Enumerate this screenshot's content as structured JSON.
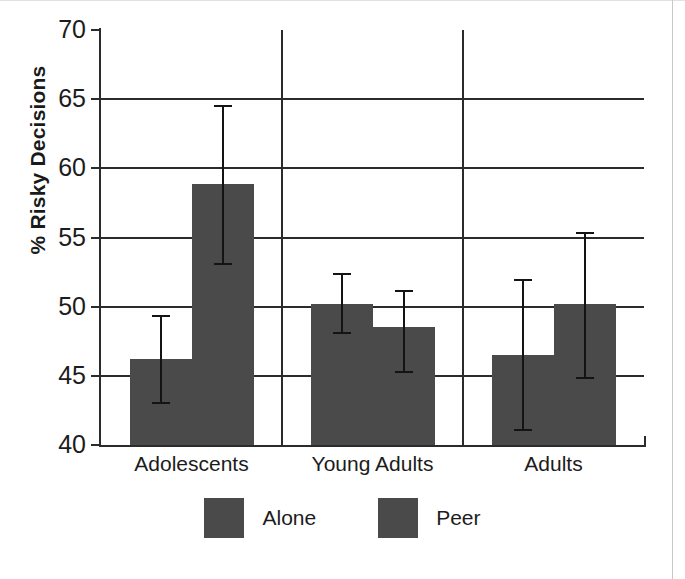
{
  "chart_data": {
    "type": "bar",
    "title": "",
    "xlabel": "",
    "ylabel": "% Risky Decisions",
    "ylim": [
      40,
      70
    ],
    "yticks": [
      40,
      45,
      50,
      55,
      60,
      65,
      70
    ],
    "ytick_labels": [
      "40",
      "45",
      "50",
      "55",
      "60",
      "65",
      "70"
    ],
    "grid": true,
    "gridlines_at": [
      45,
      50,
      55,
      60,
      65
    ],
    "group_dividers": true,
    "categories": [
      "Adolescents",
      "Young Adults",
      "Adults"
    ],
    "legend_position": "bottom",
    "bar_color": "#4a4a4a",
    "axis_color": "#2b2b2b",
    "errorbar_color": "#141414",
    "series": [
      {
        "name": "Alone",
        "values": [
          46.2,
          50.2,
          46.5
        ],
        "error_low": [
          43.0,
          48.0,
          41.0
        ],
        "error_high": [
          49.4,
          52.4,
          52.0
        ]
      },
      {
        "name": "Peer",
        "values": [
          58.9,
          48.5,
          50.2
        ],
        "error_low": [
          53.0,
          45.2,
          44.8
        ],
        "error_high": [
          64.6,
          51.2,
          55.4
        ]
      }
    ]
  },
  "legend": {
    "entries": [
      {
        "label": "Alone",
        "color": "#4a4a4a"
      },
      {
        "label": "Peer",
        "color": "#4a4a4a"
      }
    ]
  }
}
